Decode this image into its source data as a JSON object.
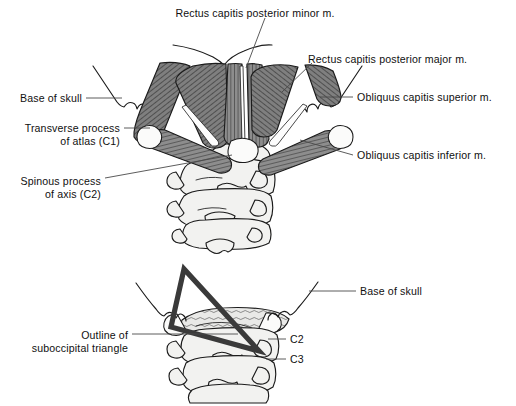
{
  "figure": {
    "width": 516,
    "height": 406,
    "background": "#ffffff",
    "ink_color": "#1b1b1b",
    "muscle_fill": "#8a8a8a",
    "muscle_fill_dark": "#6e6e6e",
    "bone_fill": "#f2f2f0",
    "leader_color": "#4a4a4a",
    "triangle_color": "#3a3a3a"
  },
  "panels": {
    "top": {
      "name": "suboccipital-muscles-posterior-view",
      "labels": [
        {
          "id": "rcpmin",
          "text": "Rectus capitis posterior minor m.",
          "x": 255,
          "y": 13,
          "anchor": "middle"
        },
        {
          "id": "rcpmaj",
          "text": "Rectus capitis posterior major m.",
          "x": 308,
          "y": 59,
          "anchor": "start"
        },
        {
          "id": "ocs",
          "text": "Obliquus capitis superior m.",
          "x": 357,
          "y": 100,
          "anchor": "start"
        },
        {
          "id": "oci",
          "text": "Obliquus capitis inferior m.",
          "x": 357,
          "y": 158,
          "anchor": "start"
        },
        {
          "id": "skull",
          "text": "Base of skull",
          "x": 82,
          "y": 101,
          "anchor": "end"
        },
        {
          "id": "tp1",
          "text": "Transverse process",
          "x": 120,
          "y": 131,
          "anchor": "end"
        },
        {
          "id": "tp2",
          "text": "of atlas (C1)",
          "x": 120,
          "y": 144,
          "anchor": "end"
        },
        {
          "id": "sp1",
          "text": "Spinous process",
          "x": 101,
          "y": 184,
          "anchor": "end"
        },
        {
          "id": "sp2",
          "text": "of axis (C2)",
          "x": 101,
          "y": 197,
          "anchor": "end"
        }
      ]
    },
    "bottom": {
      "name": "suboccipital-triangle-outline-view",
      "labels": [
        {
          "id": "skull2",
          "text": "Base of skull",
          "x": 360,
          "y": 296,
          "anchor": "start"
        },
        {
          "id": "out1",
          "text": "Outline of",
          "x": 128,
          "y": 338,
          "anchor": "end"
        },
        {
          "id": "out2",
          "text": "suboccipital triangle",
          "x": 128,
          "y": 351,
          "anchor": "end"
        },
        {
          "id": "c2",
          "text": "C2",
          "x": 290,
          "y": 342,
          "anchor": "start"
        },
        {
          "id": "c3",
          "text": "C3",
          "x": 290,
          "y": 362,
          "anchor": "start"
        }
      ]
    }
  },
  "icons": {
    "suboccipital_triangle": "triangle-outline-icon"
  }
}
